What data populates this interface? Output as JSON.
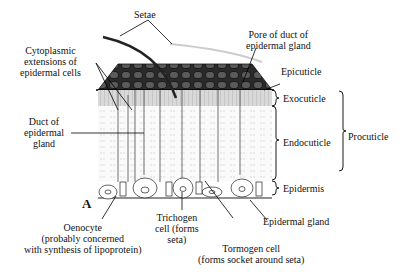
{
  "figure": {
    "panel_letter": "A",
    "labels": {
      "setae": "Setae",
      "pore_line1": "Pore of duct of",
      "pore_line2": "epidermal gland",
      "cyto_line1": "Cytoplasmic",
      "cyto_line2": "extensions of",
      "cyto_line3": "epidermal cells",
      "epicuticle": "Epicuticle",
      "exocuticle": "Exocuticle",
      "endocuticle": "Endocuticle",
      "procuticle": "Procuticle",
      "epidermis": "Epidermis",
      "duct_line1": "Duct of",
      "duct_line2": "epidermal",
      "duct_line3": "gland",
      "epidermal_gland": "Epidermal gland",
      "oenocyte_line1": "Oenocyte",
      "oenocyte_line2": "(probably concerned",
      "oenocyte_line3": "with synthesis of lipoprotein)",
      "trichogen_line1": "Trichogen",
      "trichogen_line2": "cell (forms",
      "trichogen_line3": "seta)",
      "tormogen_line1": "Tormogen cell",
      "tormogen_line2": "(forms socket around seta)"
    }
  }
}
